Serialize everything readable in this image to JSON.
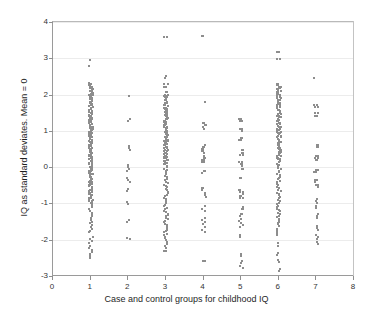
{
  "chart_data": {
    "type": "scatter",
    "title": "",
    "xlabel": "Case and control groups for childhood IQ",
    "ylabel": "IQ as standard deviates.  Mean = 0",
    "xlim": [
      0,
      8
    ],
    "ylim": [
      -3,
      4
    ],
    "xticks": [
      0,
      1,
      2,
      3,
      4,
      5,
      6,
      7,
      8
    ],
    "yticks": [
      -3,
      -2,
      -1,
      0,
      1,
      2,
      3,
      4
    ],
    "xtick_labels": [
      "0",
      "1",
      "2",
      "3",
      "4",
      "5",
      "6",
      "7",
      "8"
    ],
    "ytick_labels": [
      "-3",
      "-2",
      "-1",
      "0",
      "1",
      "2",
      "3",
      "4"
    ],
    "grid": "horizontal",
    "legend": "none",
    "marker_style": "open-square",
    "marker_color": "#8d8d8d",
    "groups": [
      {
        "name": "Group 1",
        "x": 1,
        "n": 196,
        "range": [
          -2.5,
          2.95
        ],
        "y": [
          2.95,
          2.78,
          2.32,
          2.3,
          2.28,
          2.26,
          2.24,
          2.22,
          2.2,
          2.18,
          2.16,
          2.14,
          2.12,
          2.1,
          2.08,
          2.06,
          2.04,
          2.02,
          2.0,
          1.98,
          1.96,
          1.94,
          1.92,
          1.9,
          1.88,
          1.86,
          1.84,
          1.82,
          1.8,
          1.78,
          1.76,
          1.74,
          1.72,
          1.7,
          1.68,
          1.66,
          1.64,
          1.62,
          1.6,
          1.58,
          1.56,
          1.54,
          1.52,
          1.5,
          1.48,
          1.46,
          1.44,
          1.42,
          1.4,
          1.38,
          1.36,
          1.34,
          1.32,
          1.3,
          1.28,
          1.26,
          1.24,
          1.22,
          1.2,
          1.18,
          1.16,
          1.14,
          1.12,
          1.1,
          1.08,
          1.06,
          1.04,
          1.02,
          1.0,
          0.98,
          0.96,
          0.94,
          0.92,
          0.9,
          0.88,
          0.86,
          0.84,
          0.82,
          0.8,
          0.78,
          0.76,
          0.74,
          0.72,
          0.7,
          0.68,
          0.66,
          0.64,
          0.62,
          0.6,
          0.58,
          0.56,
          0.54,
          0.52,
          0.5,
          0.48,
          0.46,
          0.44,
          0.42,
          0.4,
          0.38,
          0.36,
          0.34,
          0.32,
          0.3,
          0.28,
          0.26,
          0.24,
          0.22,
          0.2,
          0.18,
          0.16,
          0.14,
          0.12,
          0.1,
          0.08,
          0.06,
          0.04,
          0.02,
          0.0,
          -0.02,
          -0.04,
          -0.06,
          -0.08,
          -0.1,
          -0.12,
          -0.14,
          -0.16,
          -0.18,
          -0.2,
          -0.22,
          -0.24,
          -0.26,
          -0.28,
          -0.3,
          -0.32,
          -0.34,
          -0.36,
          -0.38,
          -0.4,
          -0.42,
          -0.44,
          -0.46,
          -0.48,
          -0.5,
          -0.52,
          -0.54,
          -0.56,
          -0.58,
          -0.6,
          -0.62,
          -0.64,
          -0.66,
          -0.68,
          -0.7,
          -0.72,
          -0.74,
          -0.76,
          -0.78,
          -0.8,
          -0.82,
          -0.84,
          -0.86,
          -0.88,
          -0.9,
          -0.92,
          -0.94,
          -0.96,
          -0.98,
          -1.0,
          -1.05,
          -1.1,
          -1.15,
          -1.2,
          -1.25,
          -1.3,
          -1.35,
          -1.4,
          -1.45,
          -1.5,
          -1.55,
          -1.6,
          -1.65,
          -1.7,
          -1.75,
          -1.8,
          -1.92,
          -1.98,
          -2.04,
          -2.1,
          -2.16,
          -2.22,
          -2.28,
          -2.34,
          -2.4,
          -2.46,
          -2.5
        ]
      },
      {
        "name": "Group 2",
        "x": 2,
        "n": 21,
        "range": [
          -1.98,
          1.96
        ],
        "y": [
          1.96,
          1.32,
          1.26,
          0.58,
          0.52,
          0.46,
          0.06,
          0.0,
          -0.06,
          -0.12,
          -0.3,
          -0.36,
          -0.42,
          -0.6,
          -0.66,
          -0.96,
          -1.02,
          -1.46,
          -1.52,
          -1.94,
          -1.98
        ]
      },
      {
        "name": "Group 3",
        "x": 3,
        "n": 168,
        "range": [
          -2.32,
          3.6
        ],
        "y": [
          3.6,
          2.52,
          2.46,
          2.28,
          2.22,
          2.06,
          2.0,
          1.96,
          1.92,
          1.88,
          1.84,
          1.8,
          1.76,
          1.72,
          1.68,
          1.64,
          1.6,
          1.56,
          1.52,
          1.48,
          1.44,
          1.4,
          1.36,
          1.32,
          1.28,
          1.24,
          1.2,
          1.16,
          1.12,
          1.08,
          1.04,
          1.0,
          0.96,
          0.92,
          0.88,
          0.84,
          0.8,
          0.76,
          0.72,
          0.68,
          0.64,
          0.6,
          0.56,
          0.52,
          0.48,
          0.44,
          0.4,
          0.36,
          0.32,
          0.28,
          0.24,
          0.2,
          0.16,
          0.12,
          0.08,
          0.04,
          0.0,
          -0.04,
          -0.08,
          -0.12,
          -0.16,
          -0.2,
          -0.24,
          -0.28,
          -0.32,
          -0.36,
          -0.4,
          -0.44,
          -0.48,
          -0.52,
          -0.56,
          -0.6,
          -0.64,
          -0.68,
          -0.72,
          -0.76,
          -0.8,
          -0.84,
          -0.88,
          -0.92,
          -0.96,
          -1.0,
          -1.04,
          -1.08,
          -1.12,
          -1.16,
          -1.2,
          -1.24,
          -1.28,
          -1.32,
          -1.36,
          -1.4,
          -1.44,
          -1.48,
          -1.52,
          -1.56,
          -1.6,
          -1.64,
          -1.68,
          -1.72,
          -1.76,
          -1.8,
          -1.84,
          -1.88,
          -1.92,
          -1.96,
          -2.0,
          -2.06,
          -2.12,
          -2.18,
          -2.24,
          -2.3,
          -2.32
        ]
      },
      {
        "name": "Group 4",
        "x": 4,
        "n": 52,
        "range": [
          -2.6,
          3.62
        ],
        "y": [
          3.62,
          1.8,
          1.22,
          1.16,
          1.1,
          1.04,
          0.62,
          0.56,
          0.5,
          0.44,
          0.38,
          0.32,
          0.26,
          0.2,
          0.14,
          -0.1,
          -0.16,
          -0.58,
          -0.64,
          -0.7,
          -0.76,
          -0.82,
          -1.08,
          -1.14,
          -1.2,
          -1.4,
          -1.46,
          -1.52,
          -1.58,
          -1.66,
          -1.72,
          -1.78,
          -2.58,
          -2.6
        ]
      },
      {
        "name": "Group 5",
        "x": 5,
        "n": 58,
        "range": [
          -2.78,
          1.34
        ],
        "y": [
          1.34,
          1.28,
          1.06,
          1.0,
          0.8,
          0.74,
          0.46,
          0.4,
          0.34,
          0.14,
          0.08,
          0.02,
          -0.04,
          -0.3,
          -0.62,
          -0.68,
          -0.74,
          -0.8,
          -0.86,
          -1.1,
          -1.16,
          -1.3,
          -1.36,
          -1.42,
          -1.48,
          -1.54,
          -1.6,
          -1.66,
          -1.86,
          -1.92,
          -2.4,
          -2.46,
          -2.58,
          -2.64,
          -2.72,
          -2.78
        ]
      },
      {
        "name": "Group 6",
        "x": 6,
        "n": 170,
        "range": [
          -2.86,
          3.18
        ],
        "y": [
          3.18,
          2.98,
          2.3,
          2.26,
          2.22,
          2.18,
          2.14,
          2.1,
          2.06,
          2.02,
          1.98,
          1.94,
          1.9,
          1.86,
          1.82,
          1.78,
          1.74,
          1.7,
          1.66,
          1.62,
          1.58,
          1.54,
          1.5,
          1.46,
          1.42,
          1.38,
          1.34,
          1.3,
          1.26,
          1.22,
          1.18,
          1.14,
          1.1,
          1.06,
          1.02,
          0.98,
          0.94,
          0.9,
          0.86,
          0.82,
          0.78,
          0.74,
          0.7,
          0.66,
          0.62,
          0.58,
          0.54,
          0.5,
          0.46,
          0.42,
          0.38,
          0.34,
          0.3,
          0.26,
          0.22,
          0.18,
          0.14,
          0.1,
          0.06,
          0.02,
          -0.02,
          -0.06,
          -0.1,
          -0.14,
          -0.18,
          -0.22,
          -0.26,
          -0.3,
          -0.34,
          -0.38,
          -0.42,
          -0.46,
          -0.5,
          -0.54,
          -0.58,
          -0.62,
          -0.66,
          -0.7,
          -0.74,
          -0.78,
          -0.82,
          -0.86,
          -0.9,
          -0.94,
          -0.98,
          -1.02,
          -1.06,
          -1.1,
          -1.14,
          -1.18,
          -1.22,
          -1.26,
          -1.3,
          -1.34,
          -1.38,
          -1.42,
          -1.46,
          -1.5,
          -1.54,
          -1.58,
          -1.62,
          -1.7,
          -1.76,
          -1.82,
          -1.88,
          -2.1,
          -2.16,
          -2.36,
          -2.42,
          -2.56,
          -2.62,
          -2.8,
          -2.86
        ]
      },
      {
        "name": "Group 7",
        "x": 7,
        "n": 48,
        "range": [
          -2.12,
          2.46
        ],
        "y": [
          2.46,
          1.72,
          1.66,
          1.48,
          1.42,
          0.62,
          0.56,
          0.32,
          0.26,
          0.2,
          -0.08,
          -0.14,
          -0.36,
          -0.42,
          -0.48,
          -0.54,
          -0.88,
          -0.94,
          -1.0,
          -1.06,
          -1.12,
          -1.28,
          -1.34,
          -1.4,
          -1.62,
          -1.68,
          -1.74,
          -1.86,
          -1.92,
          -1.98,
          -2.06,
          -2.12
        ]
      }
    ]
  },
  "style": {
    "axis_color": "#9a9a9a",
    "grid_color": "#ececec",
    "marker_color": "#8d8d8d",
    "text_color": "#1f1f1f",
    "background": "#ffffff"
  }
}
